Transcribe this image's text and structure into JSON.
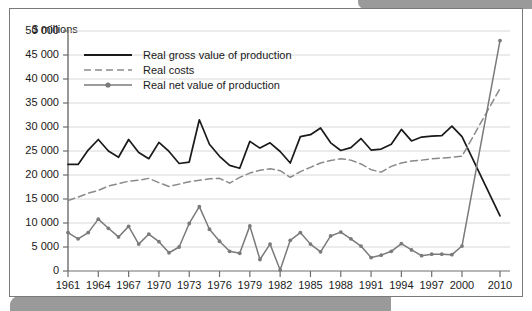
{
  "axis": {
    "y_label": "$ millions",
    "y_ticks": [
      "0",
      "5 000",
      "10 000",
      "15 000",
      "20 000",
      "25 000",
      "30 000",
      "35 000",
      "40 000",
      "45 000",
      "50 000"
    ],
    "x_ticks": [
      "1961",
      "1964",
      "1967",
      "1970",
      "1973",
      "1976",
      "1979",
      "1982",
      "1985",
      "1988",
      "1991",
      "1994",
      "1997",
      "2000",
      "2010"
    ]
  },
  "legend": {
    "items": [
      {
        "label": "Real gross value of production",
        "style": "solid",
        "color": "#1a1a1a",
        "marker": false
      },
      {
        "label": "Real costs",
        "style": "dashed",
        "color": "#8a8a8a",
        "marker": false
      },
      {
        "label": "Real net value of production",
        "style": "solid-marker",
        "color": "#7a7a7a",
        "marker": true
      }
    ]
  },
  "colors": {
    "gross": "#1a1a1a",
    "costs": "#8a8a8a",
    "net": "#7a7a7a",
    "grid": "#d8d8d8",
    "axis": "#6e6e6e",
    "frame": "#7a7a7a",
    "deco": "#9a9a9a",
    "background": "#ffffff"
  },
  "chart_data": {
    "type": "line",
    "title": "",
    "xlabel": "",
    "ylabel": "$ millions",
    "ylim": [
      0,
      50000
    ],
    "ytick_step": 5000,
    "grid": true,
    "legend_position": "top-left",
    "x_tick_labels": [
      "1961",
      "1964",
      "1967",
      "1970",
      "1973",
      "1976",
      "1979",
      "1982",
      "1985",
      "1988",
      "1991",
      "1994",
      "1997",
      "2000",
      "2010"
    ],
    "x": [
      1961,
      1962,
      1963,
      1964,
      1965,
      1966,
      1967,
      1968,
      1969,
      1970,
      1971,
      1972,
      1973,
      1974,
      1975,
      1976,
      1977,
      1978,
      1979,
      1980,
      1981,
      1982,
      1983,
      1984,
      1985,
      1986,
      1987,
      1988,
      1989,
      1990,
      1991,
      1992,
      1993,
      1994,
      1995,
      1996,
      1997,
      1998,
      1999,
      2000,
      2010
    ],
    "series": [
      {
        "name": "Real gross value of production",
        "style": "solid",
        "color": "#1a1a1a",
        "values": [
          22200,
          22200,
          25200,
          27400,
          25000,
          23700,
          27400,
          24700,
          23400,
          26800,
          24900,
          22400,
          22700,
          31500,
          26400,
          23900,
          22000,
          21400,
          27000,
          25600,
          26700,
          24900,
          22500,
          28000,
          28400,
          29800,
          26700,
          25100,
          25700,
          27600,
          25200,
          25400,
          26400,
          29500,
          27100,
          27900,
          28100,
          28200,
          30200,
          28000,
          11500
        ]
      },
      {
        "name": "Real costs",
        "style": "dashed",
        "color": "#8a8a8a",
        "values": [
          14700,
          15400,
          16200,
          16800,
          17700,
          18200,
          18700,
          18900,
          19300,
          18400,
          17600,
          18100,
          18600,
          18900,
          19200,
          19300,
          18300,
          19500,
          20400,
          21000,
          21300,
          20900,
          19500,
          20700,
          21600,
          22500,
          23000,
          23400,
          23100,
          22300,
          21100,
          20600,
          21800,
          22500,
          22900,
          23100,
          23400,
          23500,
          23700,
          23900,
          38000
        ]
      },
      {
        "name": "Real net value of production",
        "style": "solid-marker",
        "color": "#7a7a7a",
        "values": [
          8000,
          6700,
          8000,
          10800,
          8900,
          7100,
          9300,
          5600,
          7700,
          6100,
          3800,
          5000,
          9900,
          13400,
          8700,
          6200,
          4100,
          3700,
          9400,
          2400,
          5600,
          200,
          6400,
          8000,
          5600,
          4000,
          7300,
          8100,
          6700,
          5200,
          2800,
          3300,
          4100,
          5700,
          4400,
          3200,
          3500,
          3500,
          3400,
          5200,
          48000
        ]
      }
    ]
  }
}
